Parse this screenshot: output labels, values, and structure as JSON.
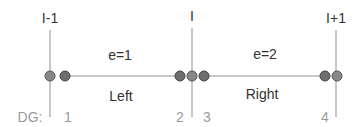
{
  "nodes": [
    {
      "label": "I-1",
      "x": 50
    },
    {
      "label": "I",
      "x": 192
    },
    {
      "label": "I+1",
      "x": 336
    }
  ],
  "elements": [
    {
      "label": "e=1",
      "side": "Left"
    },
    {
      "label": "e=2",
      "side": "Right"
    }
  ],
  "dg": {
    "prefix": "DG:",
    "numbers": [
      "1",
      "2",
      "3",
      "4"
    ]
  },
  "colors": {
    "line": "#b5b5b5",
    "dot_fill": "#6e6e6e",
    "dot_stroke": "#444444",
    "node_dot_fill": "#888888",
    "text": "#333333",
    "dg_text": "#9a9a9a"
  }
}
